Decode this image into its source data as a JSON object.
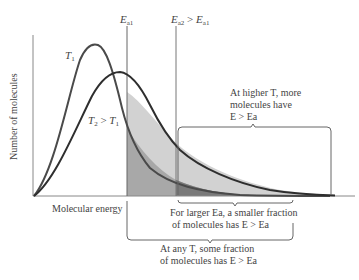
{
  "diagram": {
    "y_axis_label": "Number of molecules",
    "x_axis_label": "Molecular energy",
    "curves": [
      {
        "name": "T1",
        "label_main": "T",
        "label_sub": "1",
        "color": "#4a4a4a",
        "peak": "taller, narrower"
      },
      {
        "name": "T2",
        "label_main": "T",
        "label_sub": "2",
        "relation": "> T1",
        "color": "#2a2a2a",
        "peak": "lower, broader"
      }
    ],
    "thresholds": [
      {
        "name": "Ea1",
        "label_main": "E",
        "label_sub": "a1"
      },
      {
        "name": "Ea2",
        "label_main": "E",
        "label_sub": "a2",
        "relation": "> Ea1"
      }
    ],
    "annotations": {
      "higher_T": {
        "line1": "At higher T, more",
        "line2": "molecules have",
        "line3": "E > Ea"
      },
      "larger_Ea": {
        "line1": "For larger Ea, a smaller fraction",
        "line2": "of molecules has E > Ea"
      },
      "any_T": {
        "line1": "At any T, some fraction",
        "line2": "of molecules has E > Ea"
      }
    },
    "colors": {
      "axis": "#777777",
      "shade_light": "#cfcfcf",
      "shade_mid": "#a9a9a9",
      "shade_dark": "#7c7c7c",
      "bracket": "#666666"
    }
  }
}
